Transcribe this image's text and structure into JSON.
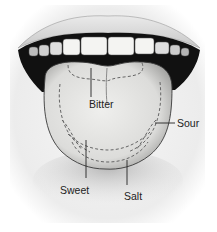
{
  "diagram": {
    "labels": {
      "bitter": "Bitter",
      "sour": "Sour",
      "sweet": "Sweet",
      "salt": "Salt"
    },
    "colors": {
      "background": "#ffffff",
      "paper": "#f2f2f2",
      "mouth": "#111111",
      "tongue": "#e6e6e4",
      "teeth": "#f4f4f2",
      "dashes": "#666666",
      "text": "#222222"
    }
  }
}
